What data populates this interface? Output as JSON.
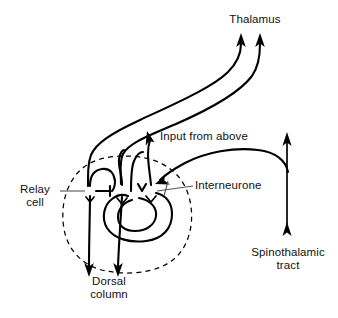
{
  "figure": {
    "type": "anatomical-schematic",
    "colors": {
      "stroke": "#000000",
      "leader": "#555555",
      "background": "#ffffff",
      "text": "#111111"
    }
  },
  "labels": {
    "thalamus": "Thalamus",
    "input_from_above": "Input from above",
    "interneurone": "Interneurone",
    "relay_cell": "Relay\ncell",
    "dorsal_column": "Dorsal\ncolumn",
    "spinothalamic_tract": "Spinothalamic\ntract"
  },
  "structures": [
    {
      "name": "relay-cell-soma",
      "kind": "neuron-cell-body",
      "cx": 90,
      "cy": 191,
      "r": 5.2
    },
    {
      "name": "second-soma",
      "kind": "neuron-cell-body",
      "cx": 122,
      "cy": 191,
      "r": 6.0
    },
    {
      "name": "interneurone-soma",
      "kind": "neuron-cell-body",
      "cx": 151,
      "cy": 191,
      "r": 5.4
    },
    {
      "name": "dorsal-horn-outline",
      "kind": "dashed-region",
      "cx": 126,
      "cy": 214,
      "rx": 63,
      "ry": 58
    }
  ],
  "pathways": [
    {
      "name": "dorsal-column-tract-left",
      "direction": "descending-arrow",
      "from": "relay-cell-soma",
      "to": "dorsal-column"
    },
    {
      "name": "dorsal-column-tract-right",
      "direction": "descending-arrow",
      "from": "second-soma",
      "to": "dorsal-column"
    },
    {
      "name": "ascending-tract-left",
      "direction": "ascending-arrow",
      "from": "relay-cell-soma",
      "to": "thalamus"
    },
    {
      "name": "ascending-tract-right",
      "direction": "ascending-arrow",
      "from": "second-soma",
      "to": "thalamus"
    },
    {
      "name": "descending-input-fibre",
      "direction": "arrow-to-label",
      "from": "interneurone-soma",
      "to": "input_from_above"
    },
    {
      "name": "spinothalamic-tract-fibre",
      "direction": "bidirectional-ascending",
      "from": "spinothalamic_tract",
      "to": "interneurone-soma"
    },
    {
      "name": "interneurone-axon-loop",
      "direction": "recurrent-loop",
      "from": "interneurone-soma",
      "to": "relay-cell-soma"
    }
  ],
  "icons": {
    "arrow_up": "arrow-up-icon",
    "arrow_down": "arrow-down-icon"
  }
}
